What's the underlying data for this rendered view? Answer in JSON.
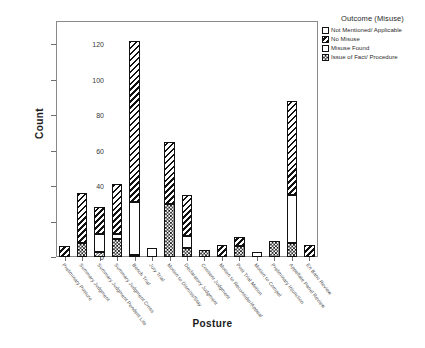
{
  "chart_data": {
    "type": "bar",
    "stacked": true,
    "title": "",
    "xlabel": "Posture",
    "ylabel": "Count",
    "ylim": [
      0,
      133
    ],
    "yticks": [
      0,
      20,
      40,
      60,
      80,
      100,
      120
    ],
    "grid": false,
    "legend_title": "Outcome (Misuse)",
    "legend_position": "top-right-outside",
    "categories": [
      "Preliminary Posture",
      "Summary Judgment",
      "Summary Judgment Pendent Lite",
      "Summary Judgment Cross",
      "Bench Trial",
      "Jury Trial",
      "Motion to Dismiss/Stay",
      "Declaratory Judgment",
      "Consent Judgment",
      "Motion to Reconsider/Appeal",
      "Post Trial Motion",
      "Motion to Compel",
      "Preliminary Injunction",
      "Appellate Panel Review",
      "En Banc Review"
    ],
    "series": [
      {
        "name": "Not Mentioned/ Applicable",
        "pattern": "plain-white",
        "values": [
          0,
          0,
          0,
          0,
          0,
          5,
          0,
          0,
          0,
          0,
          0,
          3,
          0,
          0,
          0
        ]
      },
      {
        "name": "No Misuse",
        "pattern": "diagonal-hatch",
        "values": [
          6,
          28,
          15,
          28,
          91,
          0,
          35,
          23,
          0,
          7,
          5,
          0,
          0,
          53,
          7
        ]
      },
      {
        "name": "Misuse Found",
        "pattern": "light-dots",
        "values": [
          0,
          0,
          10,
          3,
          30,
          0,
          0,
          7,
          0,
          0,
          0,
          0,
          0,
          27,
          0
        ]
      },
      {
        "name": "Issue of Fact/ Procedure",
        "pattern": "checkerboard",
        "values": [
          0,
          8,
          3,
          10,
          1,
          0,
          30,
          5,
          4,
          0,
          6,
          0,
          9,
          8,
          0
        ]
      }
    ],
    "totals": [
      6,
      36,
      28,
      41,
      122,
      5,
      65,
      35,
      4,
      7,
      11,
      3,
      9,
      88,
      7
    ]
  },
  "legend": {
    "title": "Outcome (Misuse)",
    "items": [
      {
        "label": "Not Mentioned/ Applicable",
        "pattern": "plain-white"
      },
      {
        "label": "No Misuse",
        "pattern": "diagonal-hatch"
      },
      {
        "label": "Misuse Found",
        "pattern": "light-dots"
      },
      {
        "label": "Issue of Fact/ Procedure",
        "pattern": "checkerboard"
      }
    ]
  },
  "axes": {
    "y_title": "Count",
    "x_title": "Posture",
    "y_ticks": [
      "0",
      "20",
      "40",
      "60",
      "80",
      "100",
      "120"
    ]
  }
}
